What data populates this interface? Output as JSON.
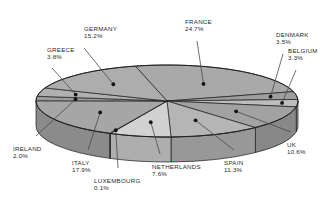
{
  "chart_data": {
    "type": "pie",
    "title": "",
    "subtitle": "",
    "xlabel": "",
    "ylabel": "",
    "legend_position": "none",
    "grid": false,
    "value_unit": "percent",
    "style": "3d-pie",
    "categories": [
      "FRANCE",
      "ITALY",
      "GERMANY",
      "SPAIN",
      "UK",
      "NETHERLANDS",
      "GREECE",
      "DENMARK",
      "BELGIUM",
      "IRELAND",
      "LUXEMBOURG"
    ],
    "values": [
      24.7,
      17.9,
      15.2,
      11.3,
      10.6,
      7.6,
      3.8,
      3.5,
      3.3,
      2.0,
      0.1
    ],
    "slices": [
      {
        "name": "FRANCE",
        "pct_text": "24.7%",
        "value": 24.7,
        "fill": "#a9a9a9",
        "side_fill": "#8f8f8f"
      },
      {
        "name": "DENMARK",
        "pct_text": "3.5%",
        "value": 3.5,
        "fill": "#9e9e9e",
        "side_fill": "#858585"
      },
      {
        "name": "BELGIUM",
        "pct_text": "3.3%",
        "value": 3.3,
        "fill": "#bdbdbd",
        "side_fill": "#9c9c9c"
      },
      {
        "name": "UK",
        "pct_text": "10.6%",
        "value": 10.6,
        "fill": "#a2a2a2",
        "side_fill": "#888888"
      },
      {
        "name": "SPAIN",
        "pct_text": "11.3%",
        "value": 11.3,
        "fill": "#b5b5b5",
        "side_fill": "#989898"
      },
      {
        "name": "NETHERLANDS",
        "pct_text": "7.6%",
        "value": 7.6,
        "fill": "#d2d2d2",
        "side_fill": "#aeaeae"
      },
      {
        "name": "LUXEMBOURG",
        "pct_text": "0.1%",
        "value": 0.1,
        "fill": "#9a9a9a",
        "side_fill": "#828282"
      },
      {
        "name": "ITALY",
        "pct_text": "17.9%",
        "value": 17.9,
        "fill": "#a6a6a6",
        "side_fill": "#8b8b8b"
      },
      {
        "name": "IRELAND",
        "pct_text": "2.0%",
        "value": 2.0,
        "fill": "#9c9c9c",
        "side_fill": "#848484"
      },
      {
        "name": "GREECE",
        "pct_text": "3.8%",
        "value": 3.8,
        "fill": "#b0b0b0",
        "side_fill": "#939393"
      },
      {
        "name": "GERMANY",
        "pct_text": "15.2%",
        "value": 15.2,
        "fill": "#adadad",
        "side_fill": "#919191"
      }
    ],
    "total": 100.0,
    "colors": {
      "background": "#ffffff",
      "outline": "#1c1c1c",
      "text": "#2b2b2b",
      "leader": "#4a4a4a",
      "marker": "#111111"
    }
  },
  "labels": {
    "germany": {
      "name": "GERMANY",
      "pct": "15.2%"
    },
    "greece": {
      "name": "GREECE",
      "pct": "3.8%"
    },
    "france": {
      "name": "FRANCE",
      "pct": "24.7%"
    },
    "denmark": {
      "name": "DENMARK",
      "pct": "3.5%"
    },
    "belgium": {
      "name": "BELGIUM",
      "pct": "3.3%"
    },
    "ireland": {
      "name": "IRELAND",
      "pct": "2.0%"
    },
    "italy": {
      "name": "ITALY",
      "pct": "17.9%"
    },
    "luxembourg": {
      "name": "LUXEMBOURG",
      "pct": "0.1%"
    },
    "netherlands": {
      "name": "NETHERLANDS",
      "pct": "7.6%"
    },
    "spain": {
      "name": "SPAIN",
      "pct": "11.3%"
    },
    "uk": {
      "name": "UK",
      "pct": "10.6%"
    }
  }
}
